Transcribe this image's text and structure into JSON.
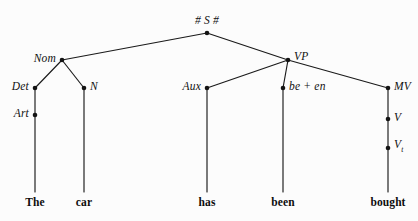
{
  "figure": {
    "type": "syntax-tree",
    "background_color": "#fcfcfc",
    "line_color": "#1a1a1a",
    "text_color": "#111111",
    "width": 418,
    "height": 221
  },
  "nodes": [
    {
      "id": "S",
      "label": "# S #",
      "sub": "",
      "x": 207,
      "y": 33,
      "label_x": 207,
      "label_y": 20,
      "anchor": "center",
      "italic": true,
      "dot": true
    },
    {
      "id": "Nom",
      "label": "Nom",
      "sub": "",
      "x": 62,
      "y": 60,
      "label_x": 56,
      "label_y": 58,
      "anchor": "right",
      "italic": true,
      "dot": true
    },
    {
      "id": "VP",
      "label": "VP",
      "sub": "",
      "x": 288,
      "y": 60,
      "label_x": 294,
      "label_y": 56,
      "anchor": "left",
      "italic": true,
      "dot": true
    },
    {
      "id": "Det",
      "label": "Det",
      "sub": "",
      "x": 35,
      "y": 88,
      "label_x": 29,
      "label_y": 86,
      "anchor": "right",
      "italic": true,
      "dot": true
    },
    {
      "id": "N",
      "label": "N",
      "sub": "",
      "x": 84,
      "y": 88,
      "label_x": 90,
      "label_y": 86,
      "anchor": "left",
      "italic": true,
      "dot": true
    },
    {
      "id": "Aux",
      "label": "Aux",
      "sub": "",
      "x": 207,
      "y": 88,
      "label_x": 201,
      "label_y": 86,
      "anchor": "right",
      "italic": true,
      "dot": true
    },
    {
      "id": "been",
      "label": "be + en",
      "sub": "",
      "x": 283,
      "y": 88,
      "label_x": 289,
      "label_y": 86,
      "anchor": "left",
      "italic": true,
      "dot": true
    },
    {
      "id": "MV",
      "label": "MV",
      "sub": "",
      "x": 388,
      "y": 88,
      "label_x": 394,
      "label_y": 86,
      "anchor": "left",
      "italic": true,
      "dot": true
    },
    {
      "id": "Art",
      "label": "Art",
      "sub": "",
      "x": 35,
      "y": 115,
      "label_x": 29,
      "label_y": 113,
      "anchor": "right",
      "italic": true,
      "dot": true
    },
    {
      "id": "V",
      "label": "V",
      "sub": "",
      "x": 388,
      "y": 119,
      "label_x": 394,
      "label_y": 117,
      "anchor": "left",
      "italic": true,
      "dot": true
    },
    {
      "id": "Vt",
      "label": "V",
      "sub": "t",
      "x": 388,
      "y": 148,
      "label_x": 394,
      "label_y": 146,
      "anchor": "left",
      "italic": true,
      "dot": true
    }
  ],
  "edges": [
    {
      "from": "S",
      "to": "Nom"
    },
    {
      "from": "S",
      "to": "VP"
    },
    {
      "from": "Nom",
      "to": "Det"
    },
    {
      "from": "Nom",
      "to": "N"
    },
    {
      "from": "VP",
      "to": "Aux"
    },
    {
      "from": "VP",
      "to": "been"
    },
    {
      "from": "VP",
      "to": "MV"
    },
    {
      "from": "Det",
      "to": "Art"
    },
    {
      "from": "MV",
      "to": "V"
    },
    {
      "from": "V",
      "to": "Vt"
    }
  ],
  "terminals": [
    {
      "word": "The",
      "x": 35,
      "line_from": "Art",
      "line_top": 115,
      "line_bottom": 192,
      "word_y": 196
    },
    {
      "word": "car",
      "x": 84,
      "line_from": "N",
      "line_top": 88,
      "line_bottom": 192,
      "word_y": 196
    },
    {
      "word": "has",
      "x": 207,
      "line_from": "Aux",
      "line_top": 88,
      "line_bottom": 192,
      "word_y": 196
    },
    {
      "word": "been",
      "x": 283,
      "line_from": "been",
      "line_top": 88,
      "line_bottom": 192,
      "word_y": 196
    },
    {
      "word": "bought",
      "x": 388,
      "line_from": "Vt",
      "line_top": 148,
      "line_bottom": 192,
      "word_y": 196
    }
  ],
  "sentence": "The car has been bought"
}
